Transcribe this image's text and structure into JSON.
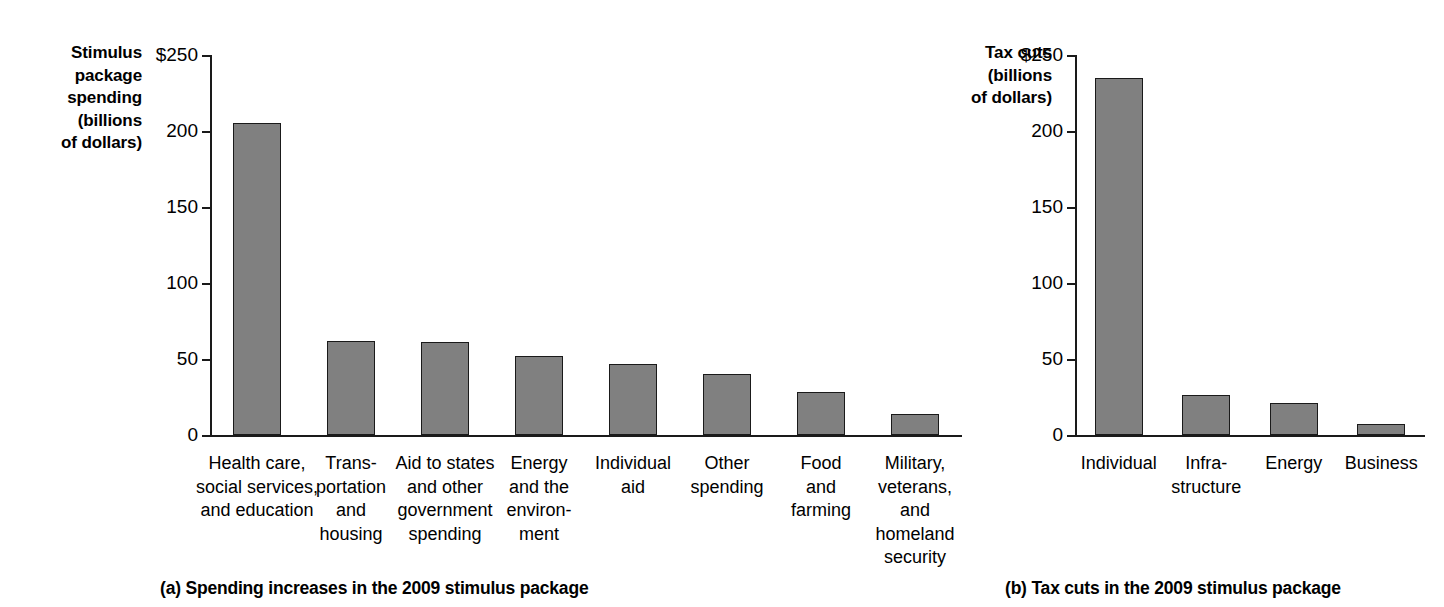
{
  "chart_data": [
    {
      "type": "bar",
      "panel": "a",
      "title": "",
      "caption": "(a) Spending increases in the 2009 stimulus package",
      "ylabel": "Stimulus\npackage\nspending\n(billions\nof dollars)",
      "xlabel": "",
      "ylim": [
        0,
        250
      ],
      "yticks": [
        0,
        50,
        100,
        150,
        200,
        250
      ],
      "ytick_labels": [
        "0",
        "50",
        "100",
        "150",
        "200",
        "$250"
      ],
      "grid": false,
      "legend": "none",
      "categories": [
        "Health care,\nsocial services,\nand education",
        "Trans-\nportation\nand\nhousing",
        "Aid to states\nand other\ngovernment\nspending",
        "Energy\nand the\nenviron-\nment",
        "Individual\naid",
        "Other\nspending",
        "Food\nand\nfarming",
        "Military,\nveterans,\nand\nhomeland\nsecurity"
      ],
      "values": [
        205,
        62,
        61,
        52,
        47,
        40,
        28,
        14
      ],
      "bar_color": "#808080"
    },
    {
      "type": "bar",
      "panel": "b",
      "title": "",
      "caption": "(b) Tax cuts in the 2009 stimulus package",
      "ylabel": "Tax cuts\n(billions\nof dollars)",
      "xlabel": "",
      "ylim": [
        0,
        250
      ],
      "yticks": [
        0,
        50,
        100,
        150,
        200,
        250
      ],
      "ytick_labels": [
        "0",
        "50",
        "100",
        "150",
        "200",
        "$250"
      ],
      "grid": false,
      "legend": "none",
      "categories": [
        "Individual",
        "Infra-\nstructure",
        "Energy",
        "Business"
      ],
      "values": [
        235,
        26,
        21,
        7
      ],
      "bar_color": "#808080"
    }
  ]
}
